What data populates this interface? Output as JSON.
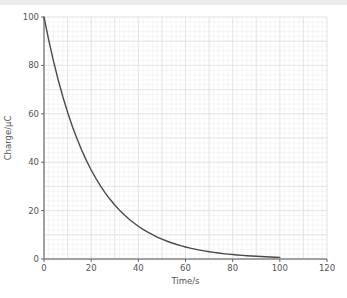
{
  "colors": {
    "background": "#ffffff",
    "top_strip": "#ececec",
    "minor_grid": "#f0f0f0",
    "major_grid": "#e1e1e1",
    "axis": "#555555",
    "tick_text": "#555555",
    "curve": "#4a4a4a"
  },
  "chart_data": {
    "type": "line",
    "title": "",
    "xlabel": "Time/s",
    "ylabel": "Charge/µC",
    "xlim": [
      0,
      120
    ],
    "ylim": [
      0,
      100
    ],
    "x_ticks": [
      0,
      20,
      40,
      60,
      80,
      100,
      120
    ],
    "y_ticks": [
      0,
      20,
      40,
      60,
      80,
      100
    ],
    "minor_grid_step": {
      "x": 2,
      "y": 2
    },
    "major_grid_step": {
      "x": 10,
      "y": 10
    },
    "grid": true,
    "legend_position": "none",
    "series": [
      {
        "name": "charge-decay",
        "x": [
          0,
          2,
          4,
          6,
          8,
          10,
          12,
          14,
          16,
          18,
          20,
          22,
          24,
          26,
          28,
          30,
          32,
          34,
          36,
          38,
          40,
          42,
          44,
          46,
          48,
          50,
          52,
          54,
          56,
          58,
          60,
          62,
          64,
          66,
          68,
          70,
          72,
          74,
          76,
          78,
          80,
          82,
          84,
          86,
          88,
          90,
          92,
          94,
          96,
          98,
          100
        ],
        "y": [
          100,
          90.48,
          81.87,
          74.08,
          67.03,
          60.65,
          54.88,
          49.66,
          44.93,
          40.66,
          36.79,
          33.29,
          30.12,
          27.25,
          24.66,
          22.31,
          20.19,
          18.27,
          16.53,
          14.96,
          13.53,
          12.25,
          11.08,
          10.03,
          9.07,
          8.21,
          7.43,
          6.72,
          6.08,
          5.5,
          4.98,
          4.5,
          4.08,
          3.69,
          3.34,
          3.02,
          2.73,
          2.47,
          2.24,
          2.02,
          1.83,
          1.66,
          1.5,
          1.36,
          1.23,
          1.11,
          1.01,
          0.91,
          0.82,
          0.75,
          0.67
        ]
      }
    ]
  }
}
